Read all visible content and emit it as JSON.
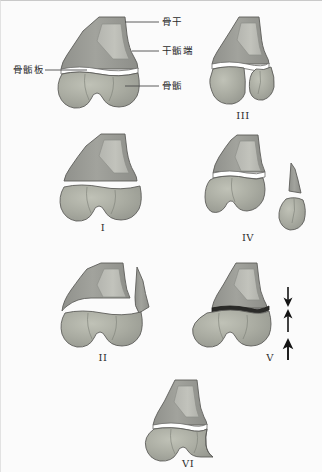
{
  "figure": {
    "title_visible": false,
    "background_color": "#fbfbfb",
    "ink_color": "#3a3a3a"
  },
  "palette": {
    "diaphysis_fill": "#9a9a96",
    "diaphysis_inner": "#b9bab4",
    "epiphysis_fill": "#a7a9a0",
    "epiphysis_highlight": "#bcbeb4",
    "outline": "#5d5d5a",
    "physis_gap": "#ffffff",
    "arrow_color": "#1c1c1c",
    "leader_color": "#4a4a4a",
    "text_color": "#2b2b2b"
  },
  "annotations": {
    "diaphysis": "骨干",
    "metaphysis": "干骺端",
    "physis": "骨骺板",
    "epiphysis": "骨骺"
  },
  "panels": [
    {
      "id": "reference",
      "numeral": "",
      "description": "Normal growth-plate anatomy with labels"
    },
    {
      "id": "type-1",
      "numeral": "I",
      "description": "Complete separation through the physis"
    },
    {
      "id": "type-2",
      "numeral": "II",
      "description": "Physeal separation with metaphyseal fragment"
    },
    {
      "id": "type-3",
      "numeral": "III",
      "description": "Fracture through physis and epiphysis"
    },
    {
      "id": "type-4",
      "numeral": "IV",
      "description": "Fracture across metaphysis, physis and epiphysis"
    },
    {
      "id": "type-5",
      "numeral": "V",
      "description": "Crush injury of the physis, compression arrows"
    },
    {
      "id": "type-6",
      "numeral": "VI",
      "description": "Peripheral perichondral ring injury"
    }
  ],
  "arrows": {
    "count": 3,
    "directions": [
      "down",
      "up",
      "up"
    ]
  }
}
